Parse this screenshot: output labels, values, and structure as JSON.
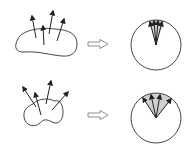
{
  "diagram": {
    "colors": {
      "stroke": "#222222",
      "wedge_fill": "#c8c8c8",
      "arrow_outline": "#555555",
      "background": "#ffffff"
    },
    "rows": [
      {
        "id": "top",
        "shape": "elongated-blob",
        "normal_count": 4,
        "mapping_arrow": "right-hollow-arrow",
        "circle": {
          "cx": 156,
          "cy": 45,
          "r": 25
        },
        "wedge_spread": "narrow"
      },
      {
        "id": "bottom",
        "shape": "kidney-blob",
        "normal_count": 4,
        "mapping_arrow": "right-hollow-arrow",
        "circle": {
          "cx": 156,
          "cy": 118,
          "r": 25
        },
        "wedge_spread": "wide"
      }
    ]
  }
}
